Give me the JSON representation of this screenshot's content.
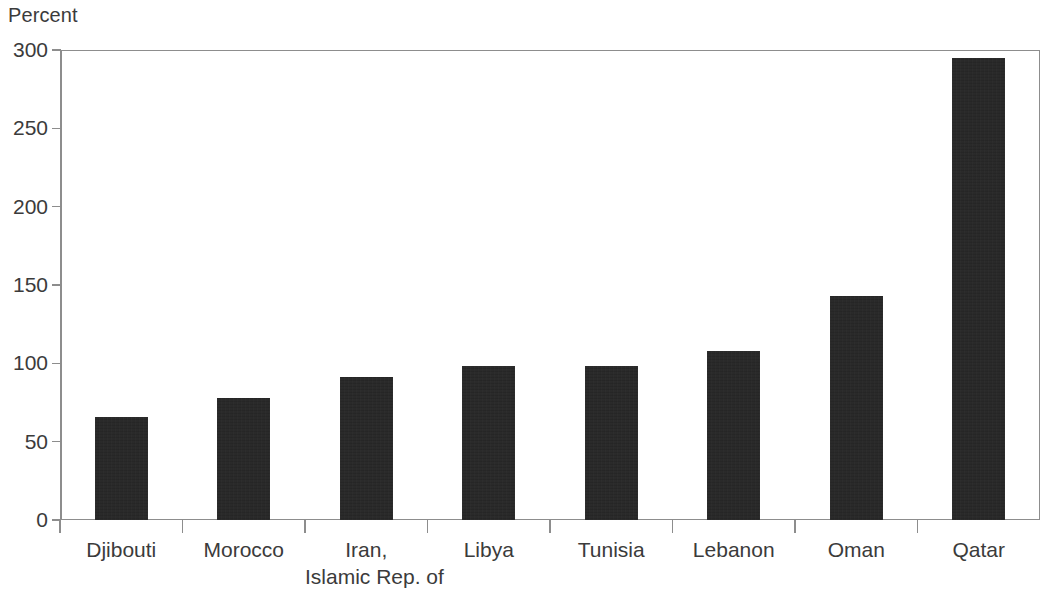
{
  "chart_data": {
    "type": "bar",
    "title": "",
    "subtitle": "",
    "xlabel": "",
    "ylabel": "Percent",
    "ylim": [
      0,
      300
    ],
    "ytick_step": 50,
    "yticks": [
      0,
      50,
      100,
      150,
      200,
      250,
      300
    ],
    "ytick_labels": [
      "0",
      "50",
      "100",
      "150",
      "200",
      "250",
      "300"
    ],
    "grid": false,
    "legend": null,
    "units": "Percent",
    "categories": [
      "Djibouti",
      "Morocco",
      "Iran, Islamic Rep. of",
      "Libya",
      "Tunisia",
      "Lebanon",
      "Oman",
      "Qatar"
    ],
    "category_lines": [
      [
        "Djibouti"
      ],
      [
        "Morocco"
      ],
      [
        "Iran,",
        "Islamic Rep. of"
      ],
      [
        "Libya"
      ],
      [
        "Tunisia"
      ],
      [
        "Lebanon"
      ],
      [
        "Oman"
      ],
      [
        "Qatar"
      ]
    ],
    "values": [
      66,
      78,
      91,
      98,
      98,
      108,
      143,
      295
    ],
    "series": [
      {
        "name": "Percent",
        "values": [
          66,
          78,
          91,
          98,
          98,
          108,
          143,
          295
        ]
      }
    ],
    "bar_color": "#262626",
    "axis_color": "#8d8d8d",
    "text_color": "#3b3b3b",
    "background_color": "#ffffff"
  },
  "axis": {
    "y_title": "Percent"
  }
}
